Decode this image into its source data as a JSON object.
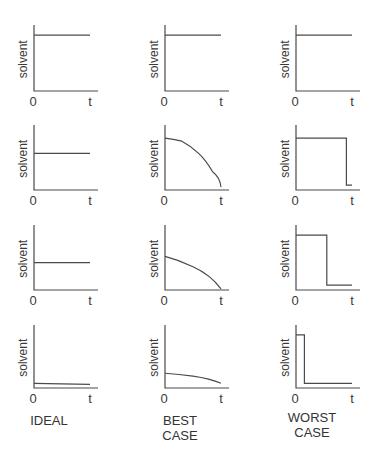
{
  "chart_data": {
    "type": "line",
    "title": "",
    "layout": {
      "rows": 4,
      "cols": 3
    },
    "columns": [
      "IDEAL",
      "BEST CASE",
      "WORST CASE"
    ],
    "xlabel_ticks": [
      "0",
      "t"
    ],
    "ylabel": "solvent",
    "grid": false,
    "panels": [
      {
        "row": 1,
        "col": "IDEAL",
        "shape": "constant",
        "points": [
          [
            0,
            0.9
          ],
          [
            1,
            0.9
          ]
        ]
      },
      {
        "row": 1,
        "col": "BEST CASE",
        "shape": "constant",
        "points": [
          [
            0,
            0.9
          ],
          [
            1,
            0.9
          ]
        ]
      },
      {
        "row": 1,
        "col": "WORST CASE",
        "shape": "constant",
        "points": [
          [
            0,
            0.9
          ],
          [
            1,
            0.9
          ]
        ]
      },
      {
        "row": 2,
        "col": "IDEAL",
        "shape": "constant",
        "points": [
          [
            0,
            0.6
          ],
          [
            1,
            0.6
          ]
        ]
      },
      {
        "row": 2,
        "col": "BEST CASE",
        "shape": "concave-decline",
        "points": [
          [
            0,
            0.85
          ],
          [
            0.3,
            0.8
          ],
          [
            0.6,
            0.6
          ],
          [
            0.85,
            0.3
          ],
          [
            1,
            0.05
          ]
        ]
      },
      {
        "row": 2,
        "col": "WORST CASE",
        "shape": "step-drop-late",
        "points": [
          [
            0,
            0.85
          ],
          [
            0.9,
            0.85
          ],
          [
            0.9,
            0.08
          ],
          [
            1,
            0.08
          ]
        ]
      },
      {
        "row": 3,
        "col": "IDEAL",
        "shape": "constant",
        "points": [
          [
            0,
            0.45
          ],
          [
            1,
            0.45
          ]
        ]
      },
      {
        "row": 3,
        "col": "BEST CASE",
        "shape": "concave-decline",
        "points": [
          [
            0,
            0.55
          ],
          [
            0.5,
            0.38
          ],
          [
            1,
            0.02
          ]
        ]
      },
      {
        "row": 3,
        "col": "WORST CASE",
        "shape": "step-drop-mid",
        "points": [
          [
            0,
            0.9
          ],
          [
            0.55,
            0.9
          ],
          [
            0.55,
            0.08
          ],
          [
            1,
            0.08
          ]
        ]
      },
      {
        "row": 4,
        "col": "IDEAL",
        "shape": "constant",
        "points": [
          [
            0,
            0.08
          ],
          [
            1,
            0.06
          ]
        ]
      },
      {
        "row": 4,
        "col": "BEST CASE",
        "shape": "slow-decline",
        "points": [
          [
            0,
            0.25
          ],
          [
            0.5,
            0.2
          ],
          [
            1,
            0.08
          ]
        ]
      },
      {
        "row": 4,
        "col": "WORST CASE",
        "shape": "step-drop-early",
        "points": [
          [
            0,
            0.9
          ],
          [
            0.15,
            0.9
          ],
          [
            0.15,
            0.08
          ],
          [
            1,
            0.08
          ]
        ]
      }
    ]
  },
  "captions": {
    "ideal": [
      "IDEAL"
    ],
    "best": [
      "BEST",
      "CASE"
    ],
    "worst": [
      "WORST",
      "CASE"
    ]
  },
  "axis": {
    "ylabel": "solvent",
    "x0": "0",
    "xt": "t"
  }
}
